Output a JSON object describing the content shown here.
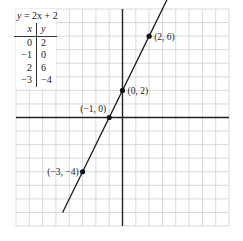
{
  "equation": {
    "prefix": "y",
    "text": " = 2x + 2"
  },
  "table": {
    "headers": [
      "x",
      "y"
    ],
    "rows": [
      [
        "0",
        "2"
      ],
      [
        "−1",
        "0"
      ],
      [
        "2",
        "6"
      ],
      [
        "−3",
        "−4"
      ]
    ]
  },
  "chart_data": {
    "type": "line",
    "title": "y = 2x + 2",
    "xlabel": "",
    "ylabel": "",
    "xlim": [
      -8,
      8
    ],
    "ylim": [
      -8,
      8
    ],
    "grid": true,
    "grid_step": 1,
    "legend": "none",
    "series": [
      {
        "name": "y = 2x + 2",
        "slope": 2,
        "intercept": 2,
        "x": [
          -4.5,
          3.5
        ],
        "y": [
          -7,
          9
        ]
      }
    ],
    "points": [
      {
        "x": 2,
        "y": 6,
        "label": "(2, 6)",
        "label_pos": "right"
      },
      {
        "x": 0,
        "y": 2,
        "label": "(0, 2)",
        "label_pos": "right"
      },
      {
        "x": -1,
        "y": 0,
        "label": "(−1, 0)",
        "label_pos": "upper-left"
      },
      {
        "x": -3,
        "y": -4,
        "label": "(−3, −4)",
        "label_pos": "left"
      }
    ],
    "colors": {
      "grid": "#cfcfcf",
      "axis": "#222222",
      "line": "#1a1a1a"
    }
  }
}
